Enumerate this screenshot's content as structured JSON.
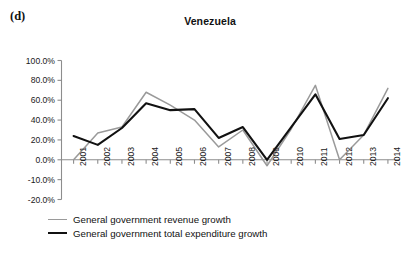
{
  "panel": {
    "label": "(d)"
  },
  "chart_data": {
    "type": "line",
    "title": "Venezuela",
    "xlabel": "",
    "ylabel": "",
    "x": [
      2001,
      2002,
      2003,
      2004,
      2005,
      2006,
      2007,
      2008,
      2009,
      2010,
      2011,
      2012,
      2013,
      2014
    ],
    "categories": [
      "2001",
      "2002",
      "2003",
      "2004",
      "2005",
      "2006",
      "2007",
      "2008",
      "2009",
      "2010",
      "2011",
      "2012",
      "2013",
      "2014"
    ],
    "series": [
      {
        "name": "General government revenue growth",
        "color": "#9a9a9a",
        "values": [
          0.0,
          27.0,
          33.0,
          68.0,
          55.0,
          40.0,
          13.0,
          30.0,
          -3.0,
          31.0,
          75.0,
          0.0,
          25.0,
          72.0
        ]
      },
      {
        "name": "General government total expenditure growth",
        "color": "#111111",
        "values": [
          24.0,
          15.0,
          32.0,
          57.0,
          50.0,
          51.0,
          22.0,
          33.0,
          0.0,
          33.0,
          66.0,
          21.0,
          25.0,
          62.0
        ]
      }
    ],
    "ylim": [
      -20,
      100
    ],
    "ytick_values": [
      100,
      80,
      60,
      40,
      20,
      0,
      -10,
      -20
    ],
    "ytick_labels": [
      "100.0%",
      "80.0%",
      "60.0%",
      "40.0%",
      "20.0%",
      "0.0%",
      "-10.0%",
      "-20.0%"
    ],
    "grid": false,
    "legend_position": "bottom-left",
    "units": "percent"
  },
  "legend": {
    "items": [
      {
        "label": "General government revenue growth",
        "color": "#9a9a9a"
      },
      {
        "label": "General government total expenditure growth",
        "color": "#111111"
      }
    ]
  }
}
